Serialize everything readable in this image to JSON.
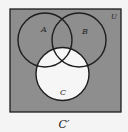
{
  "diagram": {
    "type": "venn",
    "universe_label": "U",
    "sets": [
      {
        "id": "A",
        "label": "A"
      },
      {
        "id": "B",
        "label": "B"
      },
      {
        "id": "C",
        "label": "C"
      }
    ],
    "shaded_region": "complement of C",
    "caption": "C′",
    "colors": {
      "shaded": "#8e8e8e",
      "unshaded": "#f6f6f6",
      "stroke": "#1e1e1e",
      "background": "#f4f4f4"
    }
  }
}
